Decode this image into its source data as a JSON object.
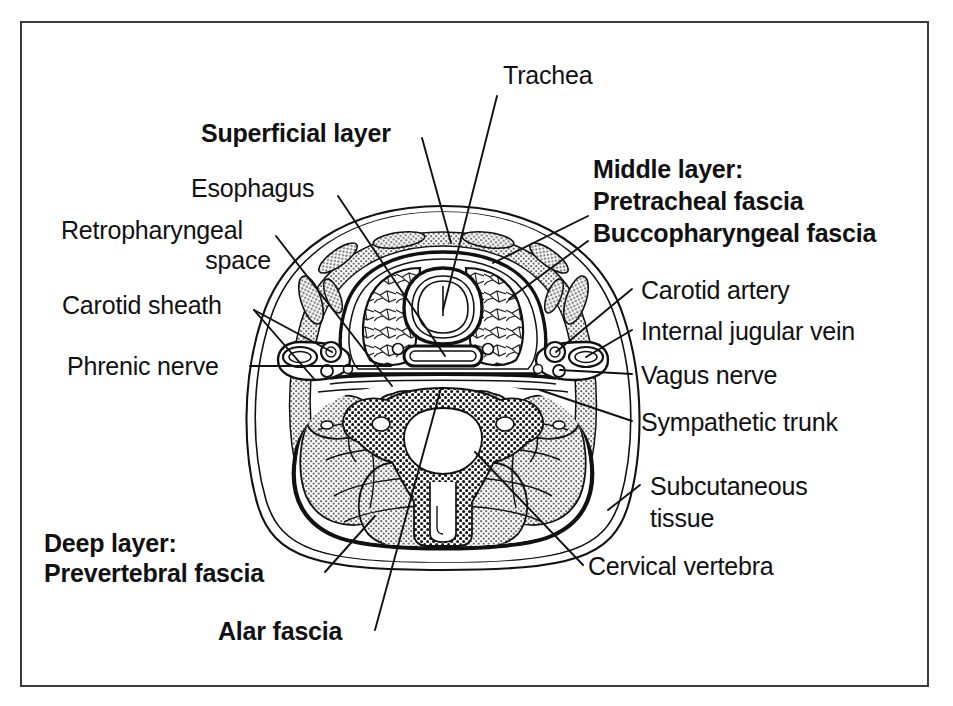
{
  "figure": {
    "type": "anatomical-cross-section",
    "border_color": "#3a3a3a",
    "ink_color": "#111111",
    "fill_shade": "#bdbdbd",
    "background": "#ffffff"
  },
  "labels": {
    "trachea": "Trachea",
    "superficial_layer": "Superficial layer",
    "esophagus": "Esophagus",
    "retropharyngeal_line1": "Retropharyngeal",
    "retropharyngeal_line2": "space",
    "carotid_sheath": "Carotid sheath",
    "phrenic_nerve": "Phrenic nerve",
    "middle_layer_heading": "Middle layer:",
    "pretracheal_fascia": "Pretracheal fascia",
    "buccopharyngeal_fascia": "Buccopharyngeal fascia",
    "carotid_artery": "Carotid artery",
    "internal_jugular_vein": "Internal jugular vein",
    "vagus_nerve": "Vagus nerve",
    "sympathetic_trunk": "Sympathetic trunk",
    "subcutaneous_line1": "Subcutaneous",
    "subcutaneous_line2": "tissue",
    "cervical_vertebra": "Cervical vertebra",
    "deep_layer_heading": "Deep layer:",
    "prevertebral_fascia": "Prevertebral fascia",
    "alar_fascia": "Alar fascia"
  },
  "label_styles": {
    "trachea": "regular",
    "superficial_layer": "bold",
    "esophagus": "regular",
    "retropharyngeal_space": "regular",
    "carotid_sheath": "regular",
    "phrenic_nerve": "regular",
    "middle_layer": "bold",
    "carotid_artery": "regular",
    "internal_jugular_vein": "regular",
    "vagus_nerve": "regular",
    "sympathetic_trunk": "regular",
    "subcutaneous_tissue": "regular",
    "cervical_vertebra": "regular",
    "deep_layer": "bold",
    "alar_fascia": "bold"
  },
  "structures": [
    "skin and subcutaneous tissue",
    "superficial layer of deep cervical fascia",
    "pretracheal fascia",
    "buccopharyngeal fascia",
    "alar fascia",
    "prevertebral fascia",
    "retropharyngeal space",
    "trachea",
    "thyroid gland lobes",
    "esophagus",
    "carotid sheath",
    "common carotid artery",
    "internal jugular vein",
    "vagus nerve",
    "sympathetic trunk",
    "phrenic nerve",
    "cervical vertebra",
    "spinal cord",
    "posterior neck musculature",
    "sternocleidomastoid muscle",
    "strap muscles"
  ]
}
